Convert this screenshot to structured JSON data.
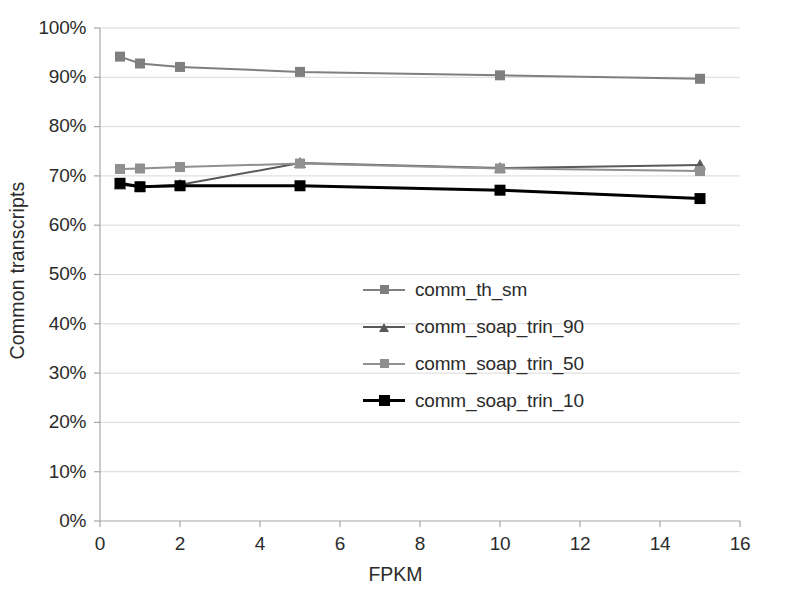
{
  "chart_data": {
    "type": "line",
    "title": "",
    "xlabel": "FPKM",
    "ylabel": "Common transcripts",
    "xlim": [
      0,
      16
    ],
    "ylim": [
      0,
      100
    ],
    "xticks": [
      0,
      2,
      4,
      6,
      8,
      10,
      12,
      14,
      16
    ],
    "xtick_labels": [
      "0",
      "2",
      "4",
      "6",
      "8",
      "10",
      "12",
      "14",
      "16"
    ],
    "yticks": [
      0,
      10,
      20,
      30,
      40,
      50,
      60,
      70,
      80,
      90,
      100
    ],
    "ytick_labels": [
      "0%",
      "10%",
      "20%",
      "30%",
      "40%",
      "50%",
      "60%",
      "70%",
      "80%",
      "90%",
      "100%"
    ],
    "grid": true,
    "grid_axis": "y",
    "legend_position": "center",
    "x": [
      0.5,
      1,
      2,
      5,
      10,
      15
    ],
    "series": [
      {
        "name": "comm_th_sm",
        "color": "#7f7f7f",
        "marker": "square",
        "values": [
          94.2,
          92.8,
          92.1,
          91.1,
          90.4,
          89.7
        ]
      },
      {
        "name": "comm_soap_trin_90",
        "color": "#595959",
        "marker": "triangle",
        "values": [
          68.2,
          67.8,
          68.2,
          72.6,
          71.6,
          72.2
        ]
      },
      {
        "name": "comm_soap_trin_50",
        "color": "#909090",
        "marker": "square",
        "values": [
          71.4,
          71.5,
          71.8,
          72.5,
          71.5,
          71.0
        ]
      },
      {
        "name": "comm_soap_trin_10",
        "color": "#000000",
        "marker": "square",
        "values": [
          68.5,
          67.8,
          68.0,
          68.0,
          67.1,
          65.4
        ]
      }
    ]
  },
  "axes": {
    "y_title": "Common transcripts",
    "x_title": "FPKM",
    "y_labels": [
      "100%",
      "90%",
      "80%",
      "70%",
      "60%",
      "50%",
      "40%",
      "30%",
      "20%",
      "10%",
      "0%"
    ],
    "x_labels": [
      "0",
      "2",
      "4",
      "6",
      "8",
      "10",
      "12",
      "14",
      "16"
    ]
  },
  "legend": {
    "items": [
      {
        "label": "comm_th_sm",
        "color": "#7f7f7f",
        "marker": "square"
      },
      {
        "label": "comm_soap_trin_90",
        "color": "#595959",
        "marker": "triangle"
      },
      {
        "label": "comm_soap_trin_50",
        "color": "#909090",
        "marker": "square"
      },
      {
        "label": "comm_soap_trin_10",
        "color": "#000000",
        "marker": "square"
      }
    ]
  },
  "colors": {
    "axis": "#a6a6a6",
    "grid": "#d9d9d9",
    "text": "#2b2b2b",
    "background": "#ffffff"
  }
}
